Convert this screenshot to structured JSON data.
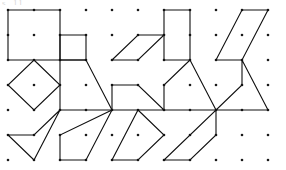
{
  "page": {
    "clipped_header_text": "s. 11",
    "background_color": "#ffffff",
    "ink_color": "#101010",
    "dot_color": "#1a1a1a"
  },
  "grid": {
    "dot_radius": 1.3,
    "cell_columns": 5,
    "cell_rows": 3,
    "dots_per_cell_x": 3,
    "dots_per_cell_y": 3,
    "unit_x": 26,
    "unit_y": 25,
    "origin_x": 8,
    "origin_y": 10,
    "total_dot_columns": 11,
    "total_dot_rows": 7
  },
  "chart_data": {
    "type": "scatter",
    "xlabel": "",
    "ylabel": "",
    "grid": true,
    "legend": "none",
    "xlim": [
      0,
      10
    ],
    "ylim": [
      0,
      6
    ],
    "shapes": [
      {
        "index": 1,
        "name": "large-square",
        "row": 0,
        "col": 0,
        "vertices": [
          [
            0,
            0
          ],
          [
            2,
            0
          ],
          [
            2,
            2
          ],
          [
            0,
            2
          ]
        ]
      },
      {
        "index": 2,
        "name": "small-square",
        "row": 0,
        "col": 1,
        "vertices": [
          [
            0,
            1
          ],
          [
            1,
            1
          ],
          [
            1,
            2
          ],
          [
            0,
            2
          ]
        ]
      },
      {
        "index": 3,
        "name": "flat-parallelogram",
        "row": 0,
        "col": 2,
        "vertices": [
          [
            0,
            2
          ],
          [
            1,
            1
          ],
          [
            2,
            1
          ],
          [
            1,
            2
          ]
        ]
      },
      {
        "index": 4,
        "name": "vertical-rectangle",
        "row": 0,
        "col": 3,
        "vertices": [
          [
            0,
            0
          ],
          [
            1,
            0
          ],
          [
            1,
            2
          ],
          [
            0,
            2
          ]
        ]
      },
      {
        "index": 5,
        "name": "steep-parallelogram",
        "row": 0,
        "col": 4,
        "vertices": [
          [
            0,
            2
          ],
          [
            1,
            0
          ],
          [
            2,
            0
          ],
          [
            1,
            2
          ]
        ]
      },
      {
        "index": 6,
        "name": "diamond-square",
        "row": 1,
        "col": 0,
        "vertices": [
          [
            1,
            0
          ],
          [
            2,
            1
          ],
          [
            1,
            2
          ],
          [
            0,
            1
          ]
        ]
      },
      {
        "index": 7,
        "name": "right-trapezoid-tall",
        "row": 1,
        "col": 1,
        "vertices": [
          [
            0,
            0
          ],
          [
            1,
            0
          ],
          [
            2,
            2
          ],
          [
            0,
            2
          ]
        ]
      },
      {
        "index": 8,
        "name": "right-trapezoid-low",
        "row": 1,
        "col": 2,
        "vertices": [
          [
            0,
            1
          ],
          [
            1,
            1
          ],
          [
            2,
            2
          ],
          [
            0,
            2
          ]
        ]
      },
      {
        "index": 9,
        "name": "kite-quadrilateral",
        "row": 1,
        "col": 3,
        "vertices": [
          [
            1,
            0
          ],
          [
            2,
            2
          ],
          [
            0,
            2
          ],
          [
            0,
            1
          ]
        ]
      },
      {
        "index": 10,
        "name": "concave-dart-right",
        "row": 1,
        "col": 4,
        "vertices": [
          [
            1,
            0
          ],
          [
            2,
            2
          ],
          [
            0,
            2
          ],
          [
            1,
            1
          ]
        ]
      },
      {
        "index": 11,
        "name": "concave-arrowhead",
        "row": 2,
        "col": 0,
        "vertices": [
          [
            2,
            0
          ],
          [
            1,
            2
          ],
          [
            0,
            1
          ],
          [
            1,
            1
          ]
        ]
      },
      {
        "index": 12,
        "name": "slanted-quadrilateral",
        "row": 2,
        "col": 1,
        "vertices": [
          [
            2,
            0
          ],
          [
            1,
            2
          ],
          [
            0,
            2
          ],
          [
            0,
            1
          ]
        ]
      },
      {
        "index": 13,
        "name": "pointed-quadrilateral",
        "row": 2,
        "col": 2,
        "vertices": [
          [
            1,
            0
          ],
          [
            2,
            1
          ],
          [
            1,
            2
          ],
          [
            0,
            2
          ]
        ]
      },
      {
        "index": 14,
        "name": "thin-parallelogram",
        "row": 2,
        "col": 3,
        "vertices": [
          [
            2,
            0
          ],
          [
            2,
            1
          ],
          [
            1,
            2
          ],
          [
            0,
            2
          ]
        ]
      },
      {
        "index": 15,
        "name": "empty-cell",
        "row": 2,
        "col": 4,
        "vertices": []
      }
    ]
  }
}
